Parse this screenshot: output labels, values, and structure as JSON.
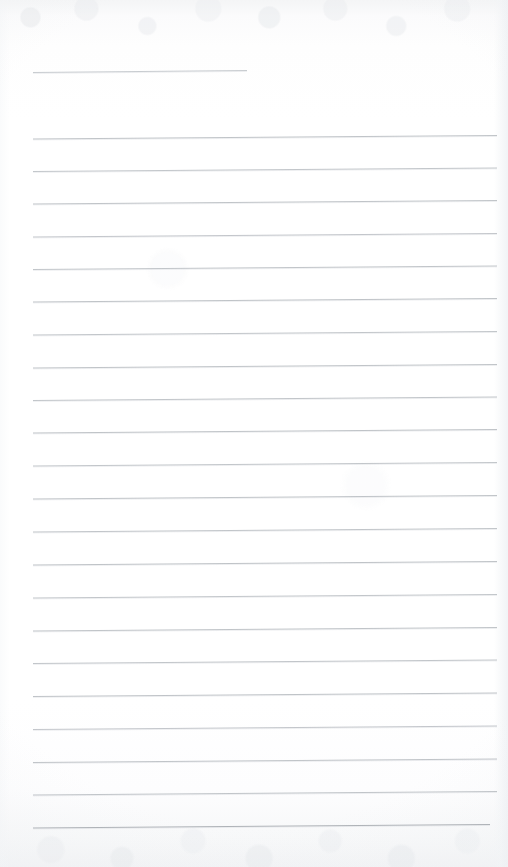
{
  "document": {
    "kind": "scanned-lined-notebook-page",
    "title": "Blank ruled writing page",
    "visible_text": "",
    "page_width": 508,
    "page_height": 867
  },
  "colors": {
    "paper": "#fefefe",
    "paper_edge_tint": "#f2f3f5",
    "rule_line": "#b9bdc2",
    "rule_line_light": "#ced2d6"
  },
  "ruling": {
    "style": "wide-ruled horizontal lines",
    "line_count": 24,
    "left_margin_x": 33,
    "right_margin_x": 497,
    "first_line_y": 72,
    "line_spacing": 32.7,
    "slope_rise": -3,
    "note": "first line is a short header rule; a full blank row is skipped beneath it"
  },
  "lines": [
    {
      "index": 1,
      "x1": 33,
      "y1": 72.5,
      "x2": 247,
      "y2": 70.5,
      "weight": 0.9,
      "shade": "#c2c6cb"
    },
    {
      "index": 2,
      "x1": 33,
      "y1": 139.0,
      "x2": 497,
      "y2": 135.5,
      "weight": 0.9,
      "shade": "#b9bdc2"
    },
    {
      "index": 3,
      "x1": 33,
      "y1": 171.5,
      "x2": 497,
      "y2": 168.0,
      "weight": 0.9,
      "shade": "#bbbfc4"
    },
    {
      "index": 4,
      "x1": 33,
      "y1": 204.0,
      "x2": 497,
      "y2": 200.5,
      "weight": 0.9,
      "shade": "#b9bdc2"
    },
    {
      "index": 5,
      "x1": 33,
      "y1": 237.0,
      "x2": 497,
      "y2": 233.5,
      "weight": 0.9,
      "shade": "#bcc0c5"
    },
    {
      "index": 6,
      "x1": 33,
      "y1": 269.5,
      "x2": 497,
      "y2": 266.0,
      "weight": 0.9,
      "shade": "#babec3"
    },
    {
      "index": 7,
      "x1": 33,
      "y1": 302.0,
      "x2": 497,
      "y2": 298.5,
      "weight": 0.9,
      "shade": "#b8bcc1"
    },
    {
      "index": 8,
      "x1": 33,
      "y1": 335.0,
      "x2": 497,
      "y2": 331.5,
      "weight": 0.9,
      "shade": "#bbbfc4"
    },
    {
      "index": 9,
      "x1": 33,
      "y1": 368.0,
      "x2": 497,
      "y2": 364.5,
      "weight": 0.9,
      "shade": "#b9bdc2"
    },
    {
      "index": 10,
      "x1": 33,
      "y1": 400.5,
      "x2": 497,
      "y2": 397.0,
      "weight": 0.9,
      "shade": "#babec3"
    },
    {
      "index": 11,
      "x1": 33,
      "y1": 433.0,
      "x2": 497,
      "y2": 429.5,
      "weight": 0.9,
      "shade": "#b8bcc1"
    },
    {
      "index": 12,
      "x1": 33,
      "y1": 466.0,
      "x2": 497,
      "y2": 462.5,
      "weight": 0.9,
      "shade": "#bbbfc4"
    },
    {
      "index": 13,
      "x1": 33,
      "y1": 499.0,
      "x2": 497,
      "y2": 495.5,
      "weight": 0.9,
      "shade": "#b9bdc2"
    },
    {
      "index": 14,
      "x1": 33,
      "y1": 532.0,
      "x2": 497,
      "y2": 528.5,
      "weight": 0.9,
      "shade": "#babec3"
    },
    {
      "index": 15,
      "x1": 33,
      "y1": 565.0,
      "x2": 497,
      "y2": 561.5,
      "weight": 0.9,
      "shade": "#b8bcc1"
    },
    {
      "index": 16,
      "x1": 33,
      "y1": 598.0,
      "x2": 497,
      "y2": 594.5,
      "weight": 0.9,
      "shade": "#bbbfc4"
    },
    {
      "index": 17,
      "x1": 33,
      "y1": 631.0,
      "x2": 497,
      "y2": 627.5,
      "weight": 0.9,
      "shade": "#b9bdc2"
    },
    {
      "index": 18,
      "x1": 33,
      "y1": 663.5,
      "x2": 497,
      "y2": 660.0,
      "weight": 0.9,
      "shade": "#babec3"
    },
    {
      "index": 19,
      "x1": 33,
      "y1": 696.5,
      "x2": 497,
      "y2": 693.0,
      "weight": 0.9,
      "shade": "#b8bcc1"
    },
    {
      "index": 20,
      "x1": 33,
      "y1": 729.5,
      "x2": 497,
      "y2": 726.0,
      "weight": 0.9,
      "shade": "#bcc0c5"
    },
    {
      "index": 21,
      "x1": 33,
      "y1": 762.5,
      "x2": 497,
      "y2": 759.0,
      "weight": 0.9,
      "shade": "#b9bdc2"
    },
    {
      "index": 22,
      "x1": 33,
      "y1": 795.0,
      "x2": 497,
      "y2": 791.5,
      "weight": 0.9,
      "shade": "#babec3"
    },
    {
      "index": 23,
      "x1": 33,
      "y1": 828.0,
      "x2": 490,
      "y2": 824.5,
      "weight": 1.0,
      "shade": "#aeb2b7"
    }
  ]
}
